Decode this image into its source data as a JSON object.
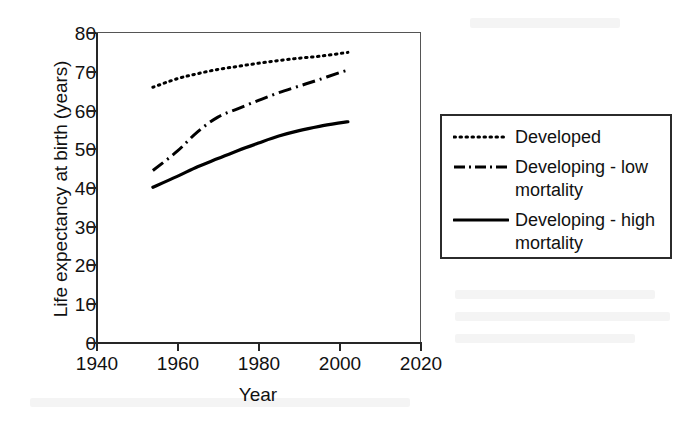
{
  "chart_data": {
    "type": "line",
    "title": "",
    "xlabel": "Year",
    "ylabel": "Life expectancy at birth (years)",
    "xlim": [
      1940,
      2020
    ],
    "ylim": [
      0,
      80
    ],
    "xticks": [
      1940,
      1960,
      1980,
      2000,
      2020
    ],
    "yticks": [
      0,
      10,
      20,
      30,
      40,
      50,
      60,
      70,
      80
    ],
    "grid": false,
    "legend_position": "right",
    "series": [
      {
        "name": "Developed",
        "style": "dotted",
        "color": "#000000",
        "x": [
          1954,
          1960,
          1965,
          1970,
          1975,
          1980,
          1985,
          1990,
          1995,
          2000,
          2002
        ],
        "values": [
          66.0,
          68.2,
          69.5,
          70.6,
          71.4,
          72.2,
          72.9,
          73.5,
          74.0,
          74.7,
          75.0
        ]
      },
      {
        "name": "Developing - low\nmortality",
        "style": "dash-dot",
        "color": "#000000",
        "x": [
          1954,
          1960,
          1965,
          1970,
          1975,
          1980,
          1985,
          1990,
          1995,
          2000,
          2002
        ],
        "values": [
          44.5,
          49.5,
          54.5,
          58.3,
          60.5,
          62.6,
          64.6,
          66.3,
          68.0,
          69.8,
          70.4
        ]
      },
      {
        "name": "Developing - high\nmortality",
        "style": "solid",
        "color": "#000000",
        "x": [
          1954,
          1960,
          1965,
          1970,
          1975,
          1980,
          1985,
          1990,
          1995,
          2000,
          2002
        ],
        "values": [
          40.2,
          43.0,
          45.5,
          47.6,
          49.7,
          51.6,
          53.4,
          54.8,
          55.9,
          56.8,
          57.1
        ]
      }
    ]
  },
  "axes": {
    "y_title": "Life expectancy at birth (years)",
    "x_title": "Year",
    "y_tick_labels": [
      "80",
      "70",
      "60",
      "50",
      "40",
      "30",
      "20",
      "10",
      "0"
    ],
    "x_tick_labels": [
      "1940",
      "1960",
      "1980",
      "2000",
      "2020"
    ]
  },
  "legend": {
    "items": [
      {
        "label": "Developed",
        "style": "dotted"
      },
      {
        "label": "Developing - low\nmortality",
        "style": "dash-dot"
      },
      {
        "label": "Developing - high\nmortality",
        "style": "solid"
      }
    ]
  },
  "colors": {
    "ink": "#111111",
    "axis": "#262626",
    "background": "#ffffff"
  }
}
